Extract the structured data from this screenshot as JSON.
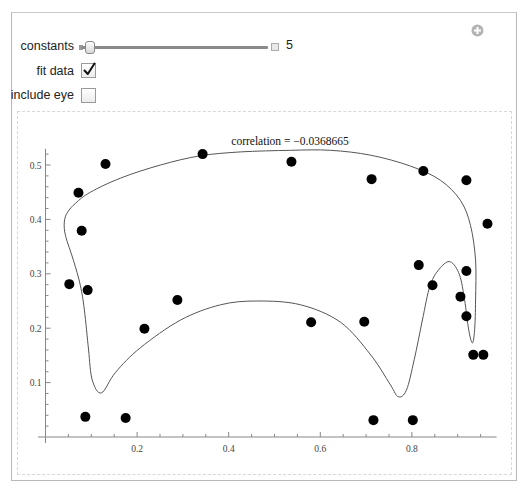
{
  "controls": {
    "constants": {
      "label": "constants",
      "value": "5",
      "slider_position": 0.03
    },
    "fit_data": {
      "label": "fit data",
      "checked": true,
      "check_glyph": "✓"
    },
    "include_eye": {
      "label": "include eye",
      "checked": false
    }
  },
  "corner_icon": "plus-circle-icon",
  "plot": {
    "title": "correlation = −0.0368665",
    "x_ticks": [
      "0.2",
      "0.4",
      "0.6",
      "0.8"
    ],
    "y_ticks": [
      "0.1",
      "0.2",
      "0.3",
      "0.4",
      "0.5"
    ]
  },
  "chart_data": {
    "type": "scatter",
    "title": "correlation = −0.0368665",
    "xlabel": "",
    "ylabel": "",
    "xlim": [
      0,
      0.985
    ],
    "ylim": [
      0,
      0.53
    ],
    "grid": false,
    "legend": null,
    "x_ticks": [
      0.2,
      0.4,
      0.6,
      0.8
    ],
    "y_ticks": [
      0.1,
      0.2,
      0.3,
      0.4,
      0.5
    ],
    "series": [
      {
        "name": "data points",
        "points": [
          [
            0.052,
            0.281
          ],
          [
            0.072,
            0.449
          ],
          [
            0.079,
            0.379
          ],
          [
            0.087,
            0.037
          ],
          [
            0.092,
            0.27
          ],
          [
            0.131,
            0.502
          ],
          [
            0.175,
            0.035
          ],
          [
            0.216,
            0.199
          ],
          [
            0.288,
            0.252
          ],
          [
            0.343,
            0.52
          ],
          [
            0.537,
            0.506
          ],
          [
            0.58,
            0.211
          ],
          [
            0.696,
            0.212
          ],
          [
            0.712,
            0.474
          ],
          [
            0.716,
            0.031
          ],
          [
            0.802,
            0.031
          ],
          [
            0.815,
            0.316
          ],
          [
            0.825,
            0.489
          ],
          [
            0.845,
            0.279
          ],
          [
            0.906,
            0.258
          ],
          [
            0.919,
            0.472
          ],
          [
            0.919,
            0.305
          ],
          [
            0.919,
            0.222
          ],
          [
            0.934,
            0.151
          ],
          [
            0.956,
            0.151
          ],
          [
            0.965,
            0.392
          ]
        ]
      },
      {
        "name": "fitted closed curve",
        "type": "line",
        "points": [
          [
            0.122,
            0.081
          ],
          [
            0.102,
            0.105
          ],
          [
            0.094,
            0.16
          ],
          [
            0.085,
            0.233
          ],
          [
            0.076,
            0.279
          ],
          [
            0.061,
            0.325
          ],
          [
            0.044,
            0.369
          ],
          [
            0.041,
            0.395
          ],
          [
            0.048,
            0.413
          ],
          [
            0.066,
            0.43
          ],
          [
            0.098,
            0.45
          ],
          [
            0.164,
            0.476
          ],
          [
            0.251,
            0.5
          ],
          [
            0.338,
            0.517
          ],
          [
            0.426,
            0.524
          ],
          [
            0.535,
            0.527
          ],
          [
            0.622,
            0.527
          ],
          [
            0.71,
            0.518
          ],
          [
            0.797,
            0.498
          ],
          [
            0.862,
            0.472
          ],
          [
            0.906,
            0.435
          ],
          [
            0.928,
            0.389
          ],
          [
            0.939,
            0.325
          ],
          [
            0.939,
            0.252
          ],
          [
            0.937,
            0.197
          ],
          [
            0.932,
            0.173
          ],
          [
            0.924,
            0.197
          ],
          [
            0.915,
            0.252
          ],
          [
            0.904,
            0.298
          ],
          [
            0.884,
            0.322
          ],
          [
            0.862,
            0.311
          ],
          [
            0.84,
            0.279
          ],
          [
            0.823,
            0.215
          ],
          [
            0.805,
            0.142
          ],
          [
            0.788,
            0.086
          ],
          [
            0.77,
            0.074
          ],
          [
            0.753,
            0.096
          ],
          [
            0.71,
            0.151
          ],
          [
            0.644,
            0.211
          ],
          [
            0.557,
            0.243
          ],
          [
            0.463,
            0.25
          ],
          [
            0.382,
            0.243
          ],
          [
            0.295,
            0.215
          ],
          [
            0.207,
            0.164
          ],
          [
            0.153,
            0.119
          ],
          [
            0.122,
            0.081
          ]
        ]
      }
    ]
  }
}
